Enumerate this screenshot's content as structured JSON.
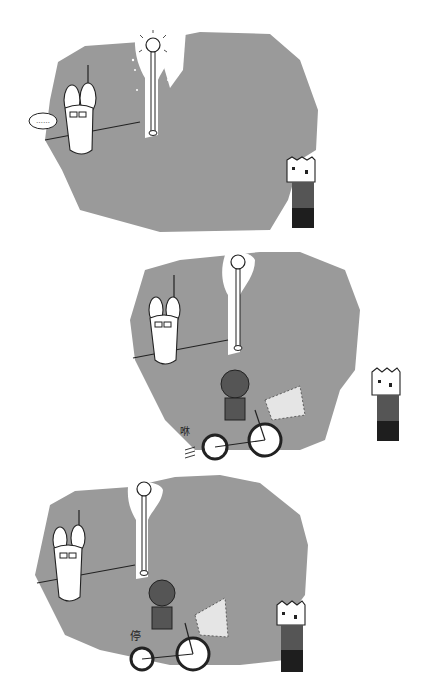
{
  "comic": {
    "panels": [
      {
        "id": 1,
        "speech_bubble": "……",
        "characters": [
          "rabbit-with-glasses",
          "lamp-post",
          "box-head-person"
        ]
      },
      {
        "id": 2,
        "sound_effect": "咻",
        "characters": [
          "rabbit-with-glasses",
          "lamp-post",
          "girl-on-bicycle",
          "box-head-person"
        ]
      },
      {
        "id": 3,
        "sound_effect": "停",
        "characters": [
          "rabbit-with-glasses",
          "lamp-post",
          "girl-on-bicycle",
          "box-head-person"
        ]
      }
    ],
    "colors": {
      "background": "#ffffff",
      "night_gray": "#9a9a9a",
      "ink": "#222222",
      "shirt": "#555555",
      "pants": "#1e1e1e"
    }
  }
}
